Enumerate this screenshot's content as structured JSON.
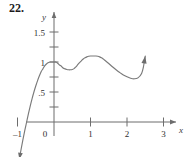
{
  "problem": {
    "number": "22."
  },
  "chart_data": {
    "type": "line",
    "title": "",
    "xlabel": "x",
    "ylabel": "y",
    "xlim": [
      -1.25,
      3.4
    ],
    "ylim": [
      -0.45,
      1.85
    ],
    "grid": false,
    "legend": null,
    "x_ticks": [
      -1,
      0,
      1,
      2,
      3
    ],
    "x_tick_labels": [
      "–1",
      "0",
      "1",
      "2",
      "3"
    ],
    "y_ticks": [
      0.25,
      0.5,
      0.75,
      1,
      1.25,
      1.5
    ],
    "y_tick_labels": [
      "",
      ".5",
      "",
      "1",
      "",
      "1.5"
    ],
    "y_labeled_ticks": [
      {
        "value": 1.5,
        "label": "1.5"
      },
      {
        "value": 1,
        "label": "1"
      },
      {
        "value": 0.5,
        "label": ".5"
      }
    ],
    "origin_label": "0",
    "axis_arrows": [
      "x-right",
      "y-up"
    ],
    "curve_arrows": [
      "down-left-end",
      "up-right-end"
    ],
    "features": [
      {
        "type": "x-intercept",
        "x": -0.75,
        "y": 0
      },
      {
        "type": "local-maximum",
        "x": 0.05,
        "y": 1.0
      },
      {
        "type": "local-minimum",
        "x": 0.45,
        "y": 0.87
      },
      {
        "type": "local-maximum",
        "x": 1.15,
        "y": 1.1
      },
      {
        "type": "local-minimum",
        "x": 2.2,
        "y": 0.72
      }
    ],
    "x": [
      -0.95,
      -0.9,
      -0.85,
      -0.8,
      -0.75,
      -0.7,
      -0.65,
      -0.6,
      -0.55,
      -0.5,
      -0.45,
      -0.4,
      -0.35,
      -0.3,
      -0.25,
      -0.2,
      -0.15,
      -0.1,
      -0.05,
      0.0,
      0.05,
      0.1,
      0.15,
      0.2,
      0.25,
      0.3,
      0.35,
      0.4,
      0.45,
      0.5,
      0.55,
      0.6,
      0.65,
      0.7,
      0.75,
      0.8,
      0.85,
      0.9,
      0.95,
      1.0,
      1.05,
      1.1,
      1.15,
      1.2,
      1.25,
      1.3,
      1.35,
      1.4,
      1.45,
      1.5,
      1.6,
      1.7,
      1.8,
      1.9,
      2.0,
      2.1,
      2.2,
      2.3,
      2.4,
      2.45,
      2.5
    ],
    "y": [
      -0.62,
      -0.45,
      -0.29,
      -0.14,
      0.0,
      0.14,
      0.27,
      0.39,
      0.5,
      0.6,
      0.69,
      0.77,
      0.84,
      0.89,
      0.94,
      0.97,
      0.99,
      1.0,
      1.0,
      1.0,
      1.0,
      0.98,
      0.95,
      0.93,
      0.9,
      0.885,
      0.875,
      0.87,
      0.87,
      0.875,
      0.89,
      0.92,
      0.955,
      0.99,
      1.02,
      1.05,
      1.07,
      1.085,
      1.095,
      1.1,
      1.1,
      1.1,
      1.1,
      1.095,
      1.085,
      1.07,
      1.05,
      1.025,
      1.0,
      0.975,
      0.92,
      0.87,
      0.825,
      0.785,
      0.755,
      0.73,
      0.72,
      0.735,
      0.81,
      0.92,
      1.1
    ]
  }
}
